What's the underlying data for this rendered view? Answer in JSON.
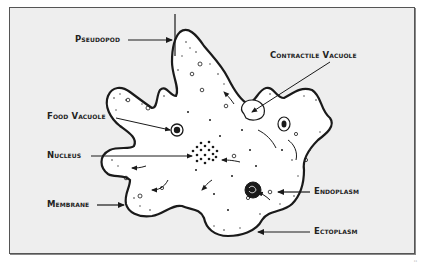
{
  "diagram": {
    "labels": {
      "pseudopod": "Pseudopod",
      "contractile_vacuole": "Contractile Vacuole",
      "food_vacuole": "Food Vacuole",
      "nucleus": "Nucleus",
      "membrane": "Membrane",
      "endoplasm": "Endoplasm",
      "ectoplasm": "Ectoplasm"
    },
    "credit": "¹¹",
    "colors": {
      "background": "#eeeeee",
      "frame_border": "#555555",
      "ink": "#1a1a1a",
      "cell_fill": "#ffffff"
    }
  }
}
